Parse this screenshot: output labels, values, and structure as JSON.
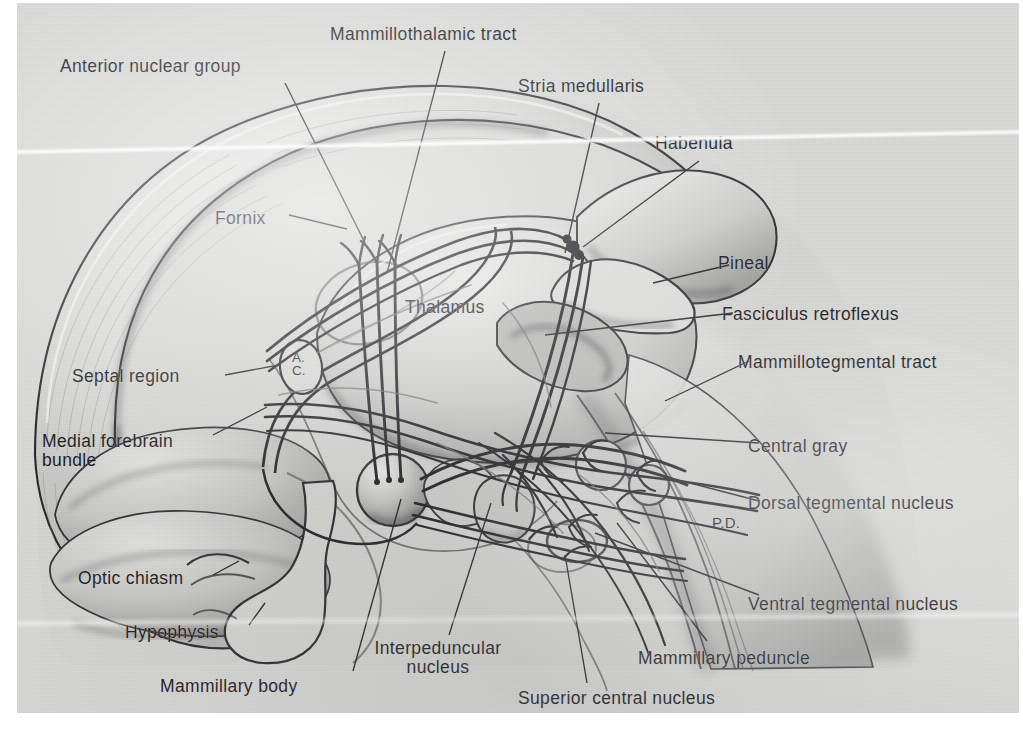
{
  "figure": {
    "type": "anatomical-illustration",
    "style": "grayscale airbrush medical illustration with leader-line labels",
    "background_color": "#d8d8d6",
    "line_color": "#1a1a1c",
    "text_color": "#15161a"
  },
  "labels": [
    {
      "id": "mammillothalamic-tract",
      "text": "Mammillothalamic tract",
      "x": 330,
      "y": 26,
      "align": "left"
    },
    {
      "id": "anterior-nuclear-group",
      "text": "Anterior nuclear group",
      "x": 60,
      "y": 58,
      "align": "left"
    },
    {
      "id": "stria-medullaris",
      "text": "Stria medullaris",
      "x": 518,
      "y": 78,
      "align": "left"
    },
    {
      "id": "habenula",
      "text": "Habenula",
      "x": 655,
      "y": 135,
      "align": "left"
    },
    {
      "id": "fornix",
      "text": "Fornix",
      "x": 215,
      "y": 210,
      "align": "left"
    },
    {
      "id": "pineal",
      "text": "Pineal",
      "x": 718,
      "y": 255,
      "align": "left"
    },
    {
      "id": "thalamus",
      "text": "Thalamus",
      "x": 405,
      "y": 299,
      "align": "left"
    },
    {
      "id": "fasciculus-retroflexus",
      "text": "Fasciculus retroflexus",
      "x": 722,
      "y": 306,
      "align": "left"
    },
    {
      "id": "mammillotegmental-tract",
      "text": "Mammillotegmental tract",
      "x": 738,
      "y": 354,
      "align": "left"
    },
    {
      "id": "septal-region",
      "text": "Septal region",
      "x": 72,
      "y": 368,
      "align": "left"
    },
    {
      "id": "medial-forebrain-bundle",
      "text": "Medial forebrain\nbundle",
      "x": 42,
      "y": 433,
      "align": "left"
    },
    {
      "id": "central-gray",
      "text": "Central gray",
      "x": 748,
      "y": 438,
      "align": "left"
    },
    {
      "id": "dorsal-tegmental-nucleus",
      "text": "Dorsal tegmental nucleus",
      "x": 748,
      "y": 495,
      "align": "left"
    },
    {
      "id": "optic-chiasm",
      "text": "Optic chiasm",
      "x": 78,
      "y": 570,
      "align": "left"
    },
    {
      "id": "ventral-tegmental-nucleus",
      "text": "Ventral tegmental nucleus",
      "x": 748,
      "y": 596,
      "align": "left"
    },
    {
      "id": "hypophysis",
      "text": "Hypophysis",
      "x": 125,
      "y": 624,
      "align": "left"
    },
    {
      "id": "interpeduncular-nucleus",
      "text": "Interpeduncular\nnucleus",
      "x": 363,
      "y": 640,
      "align": "left"
    },
    {
      "id": "mammillary-peduncle",
      "text": "Mammillary peduncle",
      "x": 638,
      "y": 650,
      "align": "left"
    },
    {
      "id": "mammillary-body",
      "text": "Mammillary body",
      "x": 160,
      "y": 678,
      "align": "left"
    },
    {
      "id": "superior-central-nucleus",
      "text": "Superior central nucleus",
      "x": 518,
      "y": 690,
      "align": "left"
    }
  ],
  "inline_annotations": [
    {
      "id": "anterior-commissure",
      "text": "A.\nC.",
      "x": 276,
      "y": 350,
      "note": "inside small oval, anterior commissure"
    },
    {
      "id": "pd-marker",
      "text": "P.D.",
      "x": 712,
      "y": 518,
      "note": "small label on brainstem"
    }
  ],
  "structures": [
    "corpus callosum",
    "fornix",
    "thalamus",
    "habenula",
    "pineal body",
    "anterior commissure",
    "septal region",
    "optic chiasm",
    "hypophysis",
    "mammillary body",
    "interpeduncular nucleus",
    "dorsal tegmental nucleus",
    "ventral tegmental nucleus",
    "superior central nucleus",
    "central gray",
    "brainstem"
  ]
}
